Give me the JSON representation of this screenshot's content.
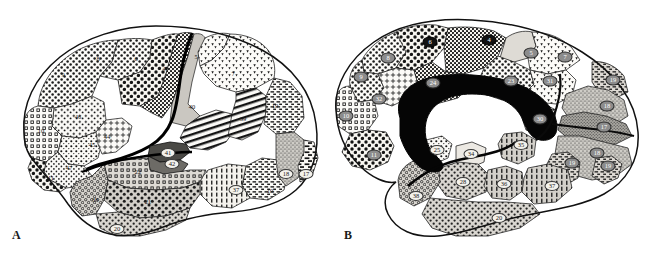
{
  "figure": {
    "type": "anatomical-diagram",
    "panels": [
      {
        "id": "A",
        "caption": "A",
        "view": "lateral",
        "areas": [
          {
            "num": "9",
            "x": 63,
            "y": 75,
            "style": "plain"
          },
          {
            "num": "8",
            "x": 98,
            "y": 59,
            "style": "plain"
          },
          {
            "num": "6",
            "x": 136,
            "y": 59,
            "style": "plain"
          },
          {
            "num": "4",
            "x": 164,
            "y": 69,
            "style": "plain"
          },
          {
            "num": "5",
            "x": 196,
            "y": 57,
            "style": "plain"
          },
          {
            "num": "7",
            "x": 233,
            "y": 74,
            "style": "plain"
          },
          {
            "num": "46",
            "x": 78,
            "y": 117,
            "style": "plain"
          },
          {
            "num": "10",
            "x": 41,
            "y": 131,
            "style": "plain"
          },
          {
            "num": "45",
            "x": 92,
            "y": 145,
            "style": "plain"
          },
          {
            "num": "44",
            "x": 107,
            "y": 137,
            "style": "plain"
          },
          {
            "num": "47",
            "x": 69,
            "y": 168,
            "style": "plain"
          },
          {
            "num": "11",
            "x": 51,
            "y": 178,
            "style": "plain"
          },
          {
            "num": "40",
            "x": 192,
            "y": 107,
            "style": "plain"
          },
          {
            "num": "39",
            "x": 243,
            "y": 119,
            "style": "plain"
          },
          {
            "num": "19",
            "x": 275,
            "y": 106,
            "style": "plain"
          },
          {
            "num": "41",
            "x": 168,
            "y": 153,
            "style": "light"
          },
          {
            "num": "42",
            "x": 172,
            "y": 164,
            "style": "light"
          },
          {
            "num": "22",
            "x": 138,
            "y": 172,
            "style": "plain"
          },
          {
            "num": "38",
            "x": 95,
            "y": 200,
            "style": "plain"
          },
          {
            "num": "21",
            "x": 148,
            "y": 202,
            "style": "plain"
          },
          {
            "num": "20",
            "x": 117,
            "y": 229,
            "style": "light"
          },
          {
            "num": "37",
            "x": 236,
            "y": 190,
            "style": "light"
          },
          {
            "num": "19",
            "x": 270,
            "y": 191,
            "style": "plain"
          },
          {
            "num": "18",
            "x": 286,
            "y": 174,
            "style": "light"
          },
          {
            "num": "17",
            "x": 306,
            "y": 174,
            "style": "light"
          }
        ]
      },
      {
        "id": "B",
        "caption": "B",
        "view": "medial",
        "areas": [
          {
            "num": "6",
            "x": 430,
            "y": 42,
            "style": "dark"
          },
          {
            "num": "4",
            "x": 489,
            "y": 40,
            "style": "dark"
          },
          {
            "num": "8",
            "x": 388,
            "y": 58,
            "style": "mid"
          },
          {
            "num": "9",
            "x": 361,
            "y": 77,
            "style": "mid"
          },
          {
            "num": "32",
            "x": 379,
            "y": 99,
            "style": "mid"
          },
          {
            "num": "10",
            "x": 346,
            "y": 116,
            "style": "mid"
          },
          {
            "num": "11",
            "x": 374,
            "y": 155,
            "style": "mid"
          },
          {
            "num": "24",
            "x": 433,
            "y": 83,
            "style": "mid"
          },
          {
            "num": "23",
            "x": 511,
            "y": 81,
            "style": "mid"
          },
          {
            "num": "31",
            "x": 550,
            "y": 81,
            "style": "mid"
          },
          {
            "num": "5",
            "x": 531,
            "y": 53,
            "style": "mid"
          },
          {
            "num": "7",
            "x": 565,
            "y": 57,
            "style": "mid"
          },
          {
            "num": "30",
            "x": 540,
            "y": 119,
            "style": "mid"
          },
          {
            "num": "19",
            "x": 613,
            "y": 80,
            "style": "mid"
          },
          {
            "num": "18",
            "x": 607,
            "y": 106,
            "style": "mid"
          },
          {
            "num": "17",
            "x": 604,
            "y": 127,
            "style": "mid"
          },
          {
            "num": "18",
            "x": 597,
            "y": 153,
            "style": "mid"
          },
          {
            "num": "19",
            "x": 572,
            "y": 163,
            "style": "mid"
          },
          {
            "num": "25",
            "x": 437,
            "y": 150,
            "style": "light"
          },
          {
            "num": "34",
            "x": 471,
            "y": 154,
            "style": "light"
          },
          {
            "num": "35",
            "x": 521,
            "y": 145,
            "style": "light"
          },
          {
            "num": "36",
            "x": 504,
            "y": 184,
            "style": "light"
          },
          {
            "num": "28",
            "x": 463,
            "y": 182,
            "style": "light"
          },
          {
            "num": "38",
            "x": 416,
            "y": 196,
            "style": "light"
          },
          {
            "num": "37",
            "x": 552,
            "y": 186,
            "style": "light"
          },
          {
            "num": "20",
            "x": 499,
            "y": 218,
            "style": "light"
          },
          {
            "num": "19",
            "x": 608,
            "y": 166,
            "style": "mid"
          }
        ]
      }
    ],
    "colors": {
      "background": "#ffffff",
      "outline": "#111111",
      "shade_light": "#f2f0ea",
      "shade_mid": "#bdbab4",
      "shade_dark": "#8d8a84",
      "label_dark": "#121212",
      "label_mid": "#8c8c8c",
      "label_light": "#f4f2ec"
    }
  }
}
